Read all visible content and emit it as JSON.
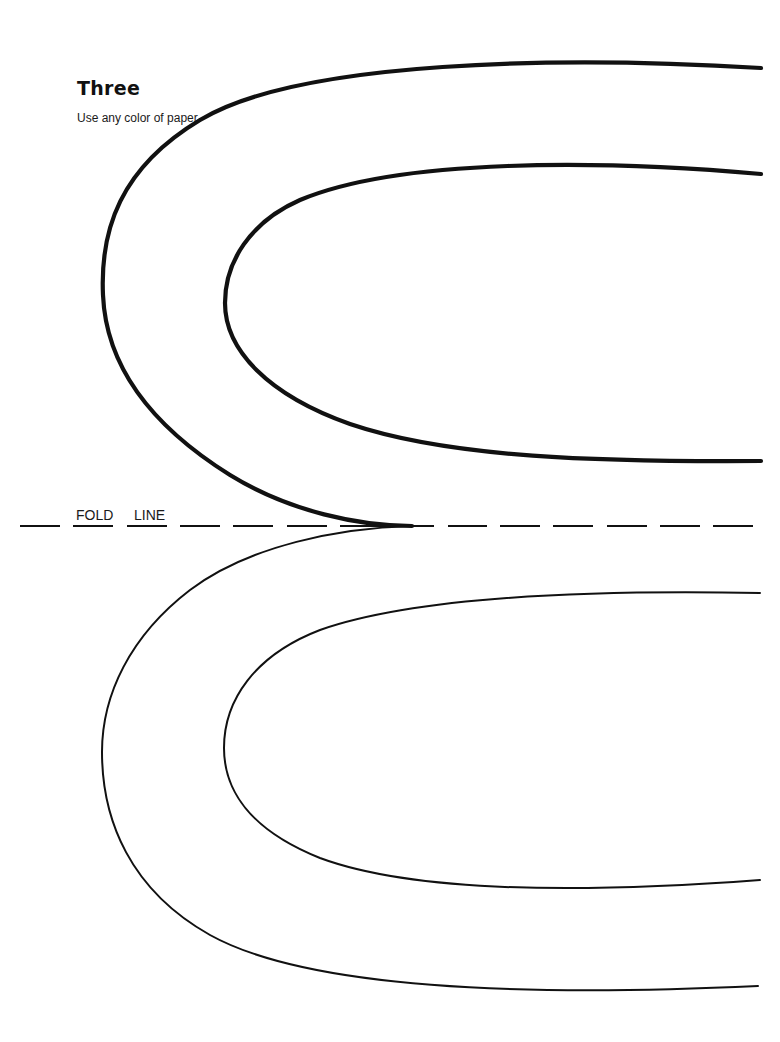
{
  "header": {
    "title": "Three",
    "instruction": "Use any color of paper."
  },
  "fold_line": {
    "words": [
      "FOLD",
      "LINE"
    ]
  },
  "colors": {
    "ink": "#111111",
    "background": "#ffffff"
  }
}
